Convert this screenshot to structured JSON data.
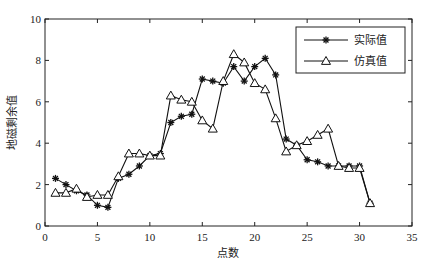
{
  "chart_data": {
    "type": "line",
    "title": "",
    "xlabel": "点数",
    "ylabel": "地磁剩余值",
    "xlim": [
      0,
      35
    ],
    "ylim": [
      0,
      10
    ],
    "xticks": [
      0,
      5,
      10,
      15,
      20,
      25,
      30,
      35
    ],
    "yticks": [
      0,
      2,
      4,
      6,
      8,
      10
    ],
    "grid": false,
    "legend_position": "upper right",
    "x": [
      1,
      2,
      3,
      4,
      5,
      6,
      7,
      8,
      9,
      10,
      11,
      12,
      13,
      14,
      15,
      16,
      17,
      18,
      19,
      20,
      21,
      22,
      23,
      24,
      25,
      26,
      27,
      28,
      29,
      30,
      31
    ],
    "series": [
      {
        "name": "实际值",
        "marker": "star",
        "values": [
          2.3,
          2.0,
          1.7,
          1.5,
          1.0,
          0.9,
          2.3,
          2.5,
          2.9,
          3.4,
          3.5,
          5.0,
          5.3,
          5.4,
          7.1,
          7.0,
          6.9,
          7.7,
          7.0,
          7.7,
          8.1,
          7.3,
          4.2,
          3.9,
          3.2,
          3.1,
          2.9,
          2.9,
          2.9,
          2.9,
          1.1
        ]
      },
      {
        "name": "仿真值",
        "marker": "triangle",
        "values": [
          1.6,
          1.6,
          1.8,
          1.4,
          1.5,
          1.5,
          2.4,
          3.5,
          3.5,
          3.4,
          3.4,
          6.3,
          6.1,
          6.0,
          5.1,
          4.7,
          7.0,
          8.3,
          7.9,
          6.9,
          6.6,
          5.2,
          3.6,
          3.9,
          4.1,
          4.4,
          4.7,
          2.9,
          2.8,
          2.8,
          1.1
        ]
      }
    ]
  },
  "colors": {
    "line": "#111111",
    "axis": "#222222",
    "background": "#ffffff"
  }
}
